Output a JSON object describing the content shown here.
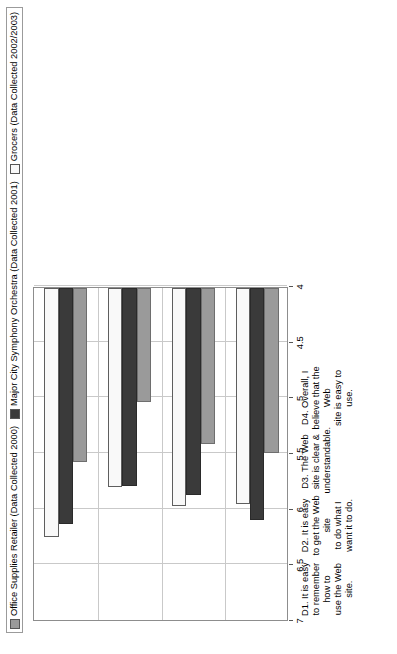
{
  "chart_data": {
    "type": "bar",
    "orientation": "horizontal",
    "title": "",
    "xlabel": "",
    "ylabel": "",
    "xlim": [
      4,
      7
    ],
    "axis_direction": "descending",
    "grid": true,
    "legend_position": "top-left",
    "tick_labels": [
      "7",
      "6.5",
      "6",
      "5.5",
      "5",
      "4.5",
      "4"
    ],
    "tick_values": [
      7,
      6.5,
      6,
      5.5,
      5,
      4.5,
      4
    ],
    "categories": [
      "D1.  It is easy to remember how to\nuse the Web site.",
      "D2.  It is easy to get the Web site\nto do what I want it to do.",
      "D3.  The Web site is clear &\nunderstandable.",
      "D4.  Overall, I believe that the Web\nsite is easy to use."
    ],
    "series": [
      {
        "name": "Office Supplies Retailer (Data Collected 2000)",
        "key": "office",
        "color": "#9a9a9a",
        "values": [
          5.56,
          5.02,
          5.4,
          5.48
        ]
      },
      {
        "name": "Major City Symphony Orchestra (Data Collected 2001)",
        "key": "orchestra",
        "color": "#3a3a3a",
        "values": [
          6.12,
          5.78,
          5.86,
          6.08
        ]
      },
      {
        "name": "Grocers (Data Collected 2002/2003)",
        "key": "grocers",
        "color": "#f9f9f9",
        "values": [
          6.24,
          5.79,
          5.96,
          5.94
        ]
      }
    ]
  },
  "legend": {
    "items": [
      {
        "label": "Office Supplies Retailer (Data Collected 2000)",
        "swatch": "office"
      },
      {
        "label": "Major City Symphony Orchestra (Data Collected 2001)",
        "swatch": "orchestra"
      },
      {
        "label": "Grocers (Data Collected 2002/2003)",
        "swatch": "grocers"
      }
    ]
  }
}
